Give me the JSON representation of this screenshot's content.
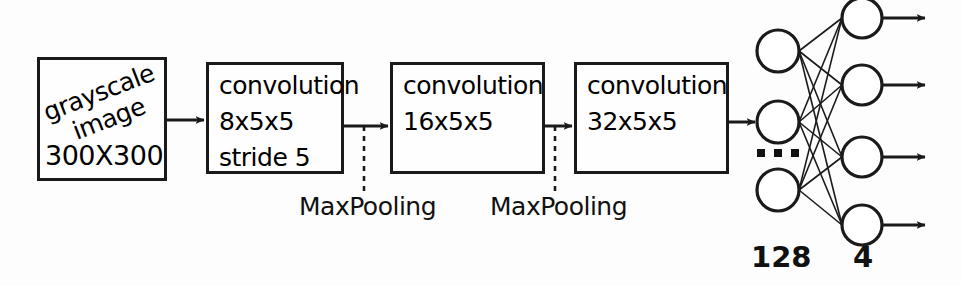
{
  "diagram": {
    "stroke_color": "#1a1a1a",
    "text_color": "#111111",
    "background_color": "#fdfdfd"
  },
  "input_block": {
    "rotated_line_1": "grayscale",
    "rotated_line_2": "image",
    "dimensions": "300X300"
  },
  "conv_blocks": [
    {
      "line1": "convolution",
      "line2": "8x5x5",
      "line3": "stride 5"
    },
    {
      "line1": "convolution",
      "line2": "16x5x5",
      "line3": ""
    },
    {
      "line1": "convolution",
      "line2": "32x5x5",
      "line3": ""
    }
  ],
  "pooling_labels": [
    {
      "text": "MaxPooling"
    },
    {
      "text": "MaxPooling"
    }
  ],
  "dense_layers": [
    {
      "label": "128",
      "visible_nodes": 3,
      "has_ellipsis": true
    },
    {
      "label": "4",
      "visible_nodes": 4,
      "has_ellipsis": false
    }
  ],
  "ellipsis": {
    "dots": 3
  }
}
